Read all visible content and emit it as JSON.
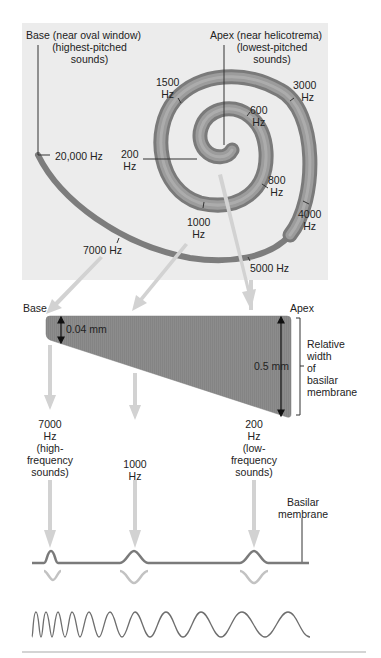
{
  "spiral": {
    "base_title": "Base (near oval window)",
    "base_sub1": "(highest-pitched",
    "base_sub2": "sounds)",
    "apex_title": "Apex (near helicotrema)",
    "apex_sub1": "(lowest-pitched",
    "apex_sub2": "sounds)",
    "freq_labels": [
      {
        "num": "1500",
        "unit": "Hz"
      },
      {
        "num": "3000",
        "unit": "Hz"
      },
      {
        "num": "600",
        "unit": "Hz"
      },
      {
        "num": "200",
        "unit": "Hz"
      },
      {
        "text": "20,000 Hz"
      },
      {
        "num": "800",
        "unit": "Hz"
      },
      {
        "num": "4000",
        "unit": "Hz"
      },
      {
        "num": "1000",
        "unit": "Hz"
      },
      {
        "text": "7000 Hz"
      },
      {
        "text": "5000 Hz"
      }
    ]
  },
  "membrane": {
    "base_label": "Base",
    "apex_label": "Apex",
    "narrow_width": "0.04 mm",
    "wide_width": "0.5 mm",
    "relative_width_lines": [
      "Relative",
      "width",
      "of",
      "basilar",
      "membrane"
    ]
  },
  "responses": [
    {
      "lines": [
        "7000",
        "Hz",
        "(high-",
        "frequency",
        "sounds)"
      ]
    },
    {
      "lines": [
        "1000",
        "Hz"
      ]
    },
    {
      "lines": [
        "200",
        "Hz",
        "(low-",
        "frequency",
        "sounds)"
      ]
    }
  ],
  "basilar_label": [
    "Basilar",
    "membrane"
  ],
  "colors": {
    "panel_bg": "#ececec",
    "spiral": "#8a8a8a",
    "spiral_dark": "#6f6f6f",
    "spiral_light": "#b8b8b8",
    "arrow": "#d2d2d2",
    "membrane_fill": "#8c8c8c",
    "line": "#333333",
    "wave": "#6e6e6e"
  }
}
